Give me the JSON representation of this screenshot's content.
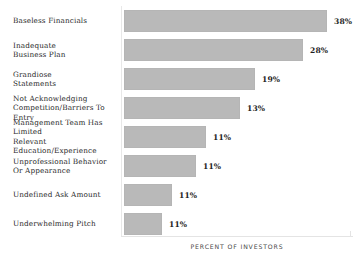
{
  "chart_data": {
    "type": "bar",
    "orientation": "horizontal",
    "title": "",
    "subtitle": "",
    "xlabel": "PERCENT OF INVESTORS",
    "ylabel": "",
    "grid": false,
    "legend": null,
    "xlim": [
      0,
      40
    ],
    "unit": "%",
    "categories": [
      "Baseless Financials",
      "Inadequate\nBusiness Plan",
      "Grandiose\nStatements",
      "Not Acknowledging\nCompetition/Barriers To Entry",
      "Management Team Has Limited\nRelevant Education/Experience",
      "Unprofessional Behavior\nOr Appearance",
      "Undefined Ask Amount",
      "Underwhelming Pitch"
    ],
    "values": [
      38,
      28,
      19,
      13,
      11,
      11,
      11,
      11
    ],
    "value_labels": [
      "38%",
      "28%",
      "19%",
      "13%",
      "11%",
      "11%",
      "11%",
      "11%"
    ],
    "bar_pixel_widths": [
      203,
      179,
      131,
      116,
      82,
      72,
      48,
      38
    ],
    "bar_color": "#b9b9b9",
    "text_color": "#2b2b2b",
    "background_color": "#ffffff",
    "axis_line_color": "#e4e4e4"
  },
  "rows": [
    {
      "label": "Baseless Financials",
      "value_label": "38%",
      "bar_width": 203,
      "top": 8
    },
    {
      "label": "Inadequate\nBusiness Plan",
      "value_label": "28%",
      "bar_width": 179,
      "top": 37
    },
    {
      "label": "Grandiose\nStatements",
      "value_label": "19%",
      "bar_width": 131,
      "top": 66
    },
    {
      "label": "Not Acknowledging\nCompetition/Barriers To Entry",
      "value_label": "13%",
      "bar_width": 116,
      "top": 95
    },
    {
      "label": "Management Team Has Limited\nRelevant Education/Experience",
      "value_label": "11%",
      "bar_width": 82,
      "top": 124
    },
    {
      "label": "Unprofessional Behavior\nOr Appearance",
      "value_label": "11%",
      "bar_width": 72,
      "top": 153
    },
    {
      "label": "Undefined Ask Amount",
      "value_label": "11%",
      "bar_width": 48,
      "top": 182
    },
    {
      "label": "Underwhelming Pitch",
      "value_label": "11%",
      "bar_width": 38,
      "top": 211
    }
  ],
  "axis": {
    "x_title": "PERCENT OF INVESTORS"
  }
}
